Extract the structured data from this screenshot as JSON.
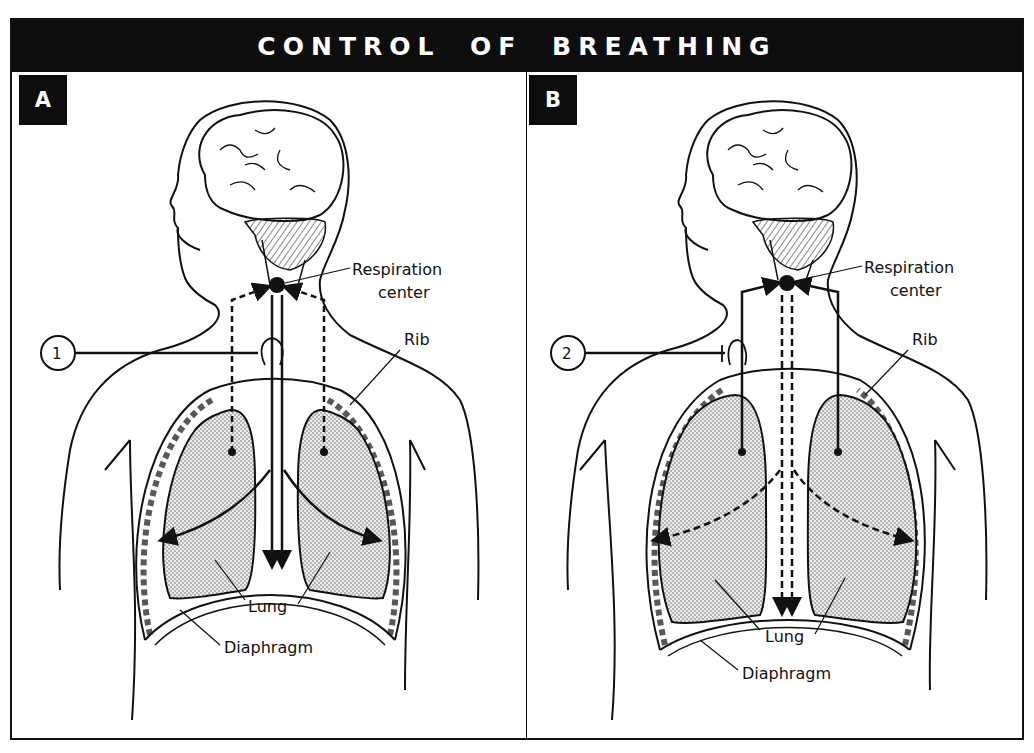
{
  "title": "CONTROL OF BREATHING",
  "panels": [
    {
      "id": "A",
      "label": "A",
      "marker": "1",
      "labels": {
        "respiration_center_line1": "Respiration",
        "respiration_center_line2": "center",
        "rib": "Rib",
        "lung": "Lung",
        "diaphragm": "Diaphragm"
      },
      "pathways": {
        "afferent_from_lungs": "dashed",
        "efferent_to_muscles": "solid"
      }
    },
    {
      "id": "B",
      "label": "B",
      "marker": "2",
      "labels": {
        "respiration_center_line1": "Respiration",
        "respiration_center_line2": "center",
        "rib": "Rib",
        "lung": "Lung",
        "diaphragm": "Diaphragm"
      },
      "pathways": {
        "afferent_from_lungs": "solid",
        "efferent_to_muscles": "dashed"
      }
    }
  ],
  "colors": {
    "ink": "#111111",
    "background": "#ffffff",
    "lung_fill": "#d9d9d9",
    "title_bar": "#0d0d0d"
  }
}
